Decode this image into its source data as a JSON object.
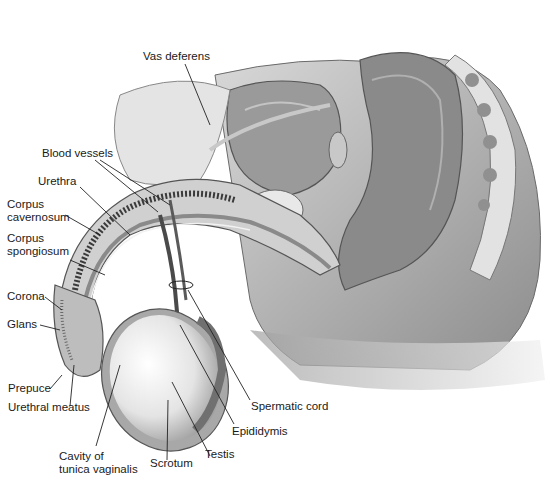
{
  "diagram": {
    "labels": {
      "vas_deferens": "Vas deferens",
      "blood_vessels": "Blood vessels",
      "urethra": "Urethra",
      "corpus_cavernosum_1": "Corpus",
      "corpus_cavernosum_2": "cavernosum",
      "corpus_spongiosum_1": "Corpus",
      "corpus_spongiosum_2": "spongiosum",
      "corona": "Corona",
      "glans": "Glans",
      "prepuce": "Prepuce",
      "urethral_meatus": "Urethral meatus",
      "cavity_1": "Cavity of",
      "cavity_2": "tunica vaginalis",
      "scrotum": "Scrotum",
      "testis": "Testis",
      "epididymis": "Epididymis",
      "spermatic_cord": "Spermatic cord"
    },
    "colors": {
      "tissue_light": "#e6e6e6",
      "tissue_mid": "#b8b8b8",
      "tissue_dark": "#7a7a7a",
      "leader_line": "#222222",
      "label_text": "#1a1a1a"
    }
  }
}
